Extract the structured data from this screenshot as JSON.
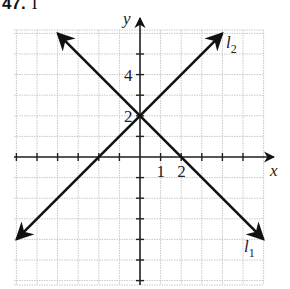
{
  "header": {
    "problem_number": "47.",
    "part": "I"
  },
  "chart_data": {
    "type": "line",
    "xlabel": "x",
    "ylabel": "y",
    "xlim": [
      -6,
      6
    ],
    "ylim": [
      -6,
      6
    ],
    "grid": true,
    "x_tick_labels": [
      {
        "value": 1,
        "label": "1"
      },
      {
        "value": 2,
        "label": "2"
      }
    ],
    "y_tick_labels": [
      {
        "value": 2,
        "label": "2"
      },
      {
        "value": 4,
        "label": "4"
      }
    ],
    "series": [
      {
        "name": "l1",
        "label": "l",
        "subscript": "1",
        "equation": "y = -x + 2",
        "points": [
          [
            -4,
            6
          ],
          [
            0,
            2
          ],
          [
            2,
            0
          ],
          [
            6,
            -4
          ]
        ]
      },
      {
        "name": "l2",
        "label": "l",
        "subscript": "2",
        "equation": "y = x + 2",
        "points": [
          [
            -6,
            -4
          ],
          [
            -2,
            0
          ],
          [
            0,
            2
          ],
          [
            4,
            6
          ]
        ]
      }
    ],
    "annotations": [
      "l1",
      "l2"
    ]
  },
  "colors": {
    "line": "#111111",
    "grid": "#c8c8c8",
    "axis": "#222222"
  }
}
